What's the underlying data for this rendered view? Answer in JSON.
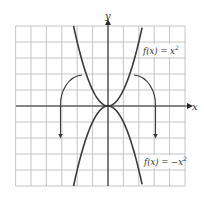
{
  "chart_data": {
    "type": "line",
    "title": "",
    "xlabel": "x",
    "ylabel": "y",
    "xlim": [
      -6,
      5
    ],
    "ylim": [
      -5,
      5
    ],
    "grid": true,
    "tick_labels": false,
    "series": [
      {
        "name": "f(x) = x^2",
        "label": "f(x) = x",
        "label_exp": "2",
        "x": [
          -2.24,
          -2,
          -1.5,
          -1,
          -0.5,
          0,
          0.5,
          1,
          1.5,
          2,
          2.24
        ],
        "y": [
          5,
          4,
          2.25,
          1,
          0.25,
          0,
          0.25,
          1,
          2.25,
          4,
          5
        ]
      },
      {
        "name": "f(x) = -x^2",
        "label": "f(x) = −x",
        "label_exp": "2",
        "x": [
          -2.24,
          -2,
          -1.5,
          -1,
          -0.5,
          0,
          0.5,
          1,
          1.5,
          2,
          2.24
        ],
        "y": [
          -5,
          -4,
          -2.25,
          -1,
          -0.25,
          0,
          -0.25,
          -1,
          -2.25,
          -4,
          -5
        ]
      }
    ],
    "annotations": [
      {
        "type": "curved-arrow",
        "description": "reflection arrow left",
        "from": [
          -1.7,
          1.9
        ],
        "to": [
          -3.1,
          -1.95
        ]
      },
      {
        "type": "curved-arrow",
        "description": "reflection arrow right",
        "from": [
          1.7,
          1.9
        ],
        "to": [
          3.1,
          -1.95
        ]
      }
    ]
  },
  "labels": {
    "x_axis": "x",
    "y_axis": "y",
    "f1_main": "f(x) = x",
    "f1_exp": "2",
    "f2_main": "f(x) = −x",
    "f2_exp": "2"
  },
  "colors": {
    "grid": "#b8b8b8",
    "axis": "#2a2a2a",
    "curve": "#3a3a3a"
  }
}
